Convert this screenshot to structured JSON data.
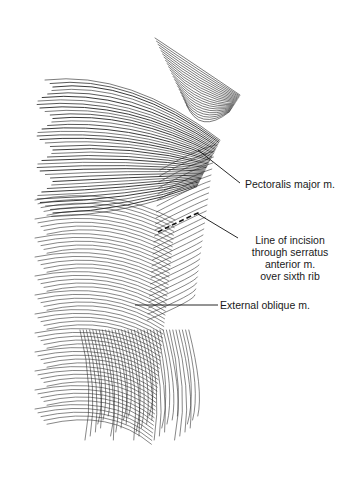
{
  "figure": {
    "labels": [
      {
        "id": "pectoralis",
        "text": "Pectoralis major m."
      },
      {
        "id": "incision",
        "lines": [
          "Line of incision",
          "through serratus",
          "anterior m.",
          "over sixth rib"
        ]
      },
      {
        "id": "external_oblique",
        "text": "External oblique m."
      }
    ],
    "colors": {
      "ink": "#1a1a1a",
      "background": "#ffffff"
    }
  }
}
